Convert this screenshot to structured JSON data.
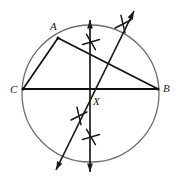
{
  "figure": {
    "width": 177,
    "height": 183,
    "background_color": "#ffffff",
    "circle_color": "#6f6f6f",
    "chord_color": "#111111",
    "construction_color": "#1a1a1a",
    "label_color": "#1a1a1a"
  },
  "circle": {
    "name": "main-circle",
    "center_x": 90.5,
    "center_y": 93.5,
    "radius": 68.5,
    "stroke_width": 1.3
  },
  "points": [
    {
      "id": "A",
      "label": "A",
      "x": 58,
      "y": 38,
      "label_x": 50,
      "label_y": 30
    },
    {
      "id": "C",
      "label": "C",
      "x": 23,
      "y": 89,
      "label_x": 10,
      "label_y": 93
    },
    {
      "id": "B",
      "label": "B",
      "x": 158,
      "y": 89,
      "label_x": 163,
      "label_y": 92
    },
    {
      "id": "X",
      "label": "X",
      "x": 90,
      "y": 89,
      "label_x": 93,
      "label_y": 105
    }
  ],
  "chords": [
    {
      "name": "chord-A-C",
      "x1": 58,
      "y1": 38,
      "x2": 23,
      "y2": 89,
      "stroke_width": 1.7
    },
    {
      "name": "chord-A-B",
      "x1": 58,
      "y1": 38,
      "x2": 158,
      "y2": 89,
      "stroke_width": 1.7
    },
    {
      "name": "chord-C-B",
      "x1": 23,
      "y1": 89,
      "x2": 158,
      "y2": 89,
      "stroke_width": 1.9
    }
  ],
  "construction_lines": [
    {
      "name": "vertical-construction-line",
      "x1": 90,
      "y1": 20,
      "x2": 90,
      "y2": 172,
      "stroke_width": 1.7,
      "arrow_start": true,
      "arrow_end": true
    },
    {
      "name": "diagonal-construction-line",
      "x1": 134,
      "y1": 11,
      "x2": 56,
      "y2": 170,
      "stroke_width": 1.7,
      "arrow_start": true,
      "arrow_end": true
    }
  ],
  "arc_marks": [
    {
      "name": "arc-mark-upper-vertical",
      "cx": 91,
      "cy": 42,
      "angle": 22,
      "size": 7
    },
    {
      "name": "arc-mark-upper-diagonal",
      "cx": 123,
      "cy": 24,
      "angle": 115,
      "size": 7
    },
    {
      "name": "arc-mark-lower-diagonal",
      "cx": 79,
      "cy": 116,
      "angle": 115,
      "size": 7
    },
    {
      "name": "arc-mark-lower-vertical",
      "cx": 91,
      "cy": 137,
      "angle": 22,
      "size": 7
    }
  ]
}
